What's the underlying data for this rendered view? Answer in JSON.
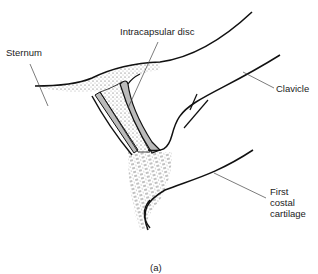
{
  "figure": {
    "caption": "(a)",
    "labels": {
      "sternum": "Sternum",
      "intracapsular_disc": "Intracapsular disc",
      "clavicle": "Clavicle",
      "first_costal_cartilage": "First\ncostal\ncartilage"
    }
  }
}
